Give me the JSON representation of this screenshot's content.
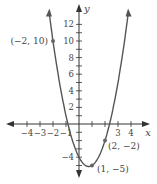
{
  "chart_data": {
    "type": "line",
    "title": "",
    "xlabel": "x",
    "ylabel": "y",
    "function": "y = 2x^2 - 3x - 4",
    "xlim": [
      -4.5,
      4.5
    ],
    "ylim": [
      -6,
      13
    ],
    "x_ticks": [
      -4,
      -3,
      -2,
      -1,
      1,
      2,
      3,
      4
    ],
    "x_tick_labels": [
      "-4",
      "-3",
      "-2",
      "-1",
      "3",
      "4"
    ],
    "y_ticks": [
      -5,
      -4,
      -3,
      -2,
      -1,
      1,
      2,
      3,
      4,
      5,
      6,
      7,
      8,
      9,
      10,
      11,
      12
    ],
    "y_tick_labels": [
      "12",
      "10",
      "8",
      "6",
      "4",
      "2",
      "-4"
    ],
    "points": [
      {
        "x": -2,
        "y": 10,
        "label": "(−2, 10)"
      },
      {
        "x": 1,
        "y": -5,
        "label": "(1, −5)"
      },
      {
        "x": 2,
        "y": -2,
        "label": "(2, −2)"
      }
    ],
    "grid": false,
    "legend": null
  },
  "axes": {
    "x_label": "x",
    "y_label": "y"
  },
  "colors": {
    "curve": "#555555",
    "axis": "#333333",
    "point": "#666666"
  }
}
